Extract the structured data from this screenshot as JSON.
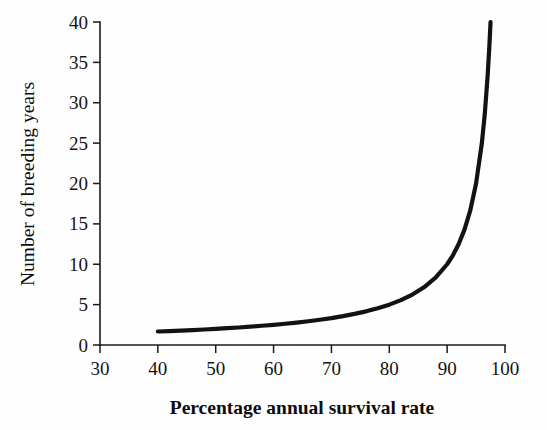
{
  "chart_data": {
    "type": "line",
    "title": "",
    "subtitle": "",
    "xlabel": "Percentage annual survival rate",
    "ylabel": "Number of breeding years",
    "xlim": [
      30,
      100
    ],
    "ylim": [
      0,
      40
    ],
    "xticks": [
      30,
      40,
      50,
      60,
      70,
      80,
      90,
      100
    ],
    "xticklabels": [
      "30",
      "40",
      "50",
      "60",
      "70",
      "80",
      "90",
      "100"
    ],
    "yticks": [
      0,
      5,
      10,
      15,
      20,
      25,
      30,
      35,
      40
    ],
    "yticklabels": [
      "0",
      "5",
      "10",
      "15",
      "20",
      "25",
      "30",
      "35",
      "40"
    ],
    "grid": false,
    "legend": null,
    "legend_position": "none",
    "annotations": [],
    "series": [
      {
        "name": "Expected number of breeding years",
        "relation": "y = 1 / (1 - x/100)",
        "color": "#121212",
        "linewidth": 4.2,
        "x": [
          40,
          42,
          44,
          46,
          48,
          50,
          52,
          54,
          56,
          58,
          60,
          62,
          64,
          66,
          68,
          70,
          72,
          74,
          76,
          78,
          80,
          82,
          84,
          86,
          88,
          90,
          91,
          92,
          93,
          94,
          95,
          96,
          96.5,
          97,
          97.3,
          97.5
        ],
        "values": [
          1.67,
          1.72,
          1.79,
          1.85,
          1.92,
          2.0,
          2.08,
          2.17,
          2.27,
          2.38,
          2.5,
          2.63,
          2.78,
          2.94,
          3.13,
          3.33,
          3.57,
          3.85,
          4.17,
          4.55,
          5.0,
          5.56,
          6.25,
          7.14,
          8.33,
          10.0,
          11.11,
          12.5,
          14.29,
          16.67,
          20.0,
          25.0,
          28.57,
          33.33,
          37.04,
          40.0
        ]
      }
    ]
  },
  "axes": {
    "x_title": "Percentage annual survival rate",
    "y_title": "Number of breeding years"
  }
}
